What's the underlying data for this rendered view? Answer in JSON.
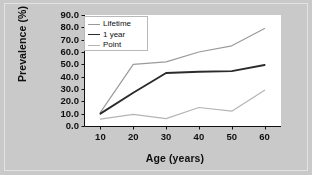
{
  "chart_data": {
    "type": "line",
    "title": "",
    "xlabel": "Age (years)",
    "ylabel": "Prevalence (%)",
    "x": [
      10,
      20,
      30,
      40,
      50,
      60
    ],
    "xlim": [
      5,
      65
    ],
    "ylim": [
      0,
      90
    ],
    "xticks": [
      "10",
      "20",
      "30",
      "40",
      "50",
      "60"
    ],
    "yticks": [
      "0.0",
      "10.0",
      "20.0",
      "30.0",
      "40.0",
      "50.0",
      "60.0",
      "70.0",
      "80.0",
      "90.0"
    ],
    "grid": false,
    "legend_position": "upper-left-inside",
    "series": [
      {
        "name": "Lifetime",
        "color": "#9a9a9a",
        "values": [
          11.0,
          50.0,
          52.0,
          60.0,
          65.0,
          79.0
        ]
      },
      {
        "name": "1 year",
        "color": "#2b2b2b",
        "values": [
          10.0,
          27.0,
          43.0,
          44.0,
          44.5,
          49.5
        ]
      },
      {
        "name": "Point",
        "color": "#b5b5b5",
        "values": [
          5.5,
          9.5,
          6.0,
          15.0,
          12.0,
          29.0
        ]
      }
    ]
  },
  "figure": {
    "background_color": "#c9c9c9",
    "plot_background_color": "#ffffff",
    "border_color": "#e3e3e3",
    "axis_color": "#101010"
  }
}
